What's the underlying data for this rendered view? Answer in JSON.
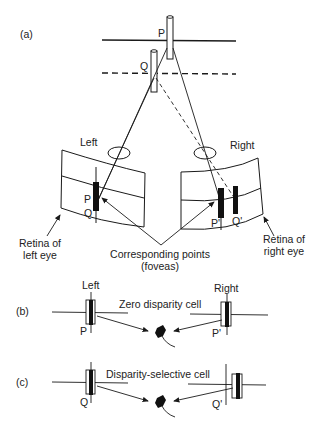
{
  "panels": {
    "a": {
      "label": "(a)",
      "point_p": "P",
      "point_q": "Q",
      "left_eye_label": "Left",
      "right_eye_label": "Right",
      "retina_left_p": "P",
      "retina_left_q": "Q",
      "retina_right_p": "P'",
      "retina_right_q": "Q'",
      "retina_left_caption_line1": "Retina of",
      "retina_left_caption_line2": "left eye",
      "retina_right_caption_line1": "Retina of",
      "retina_right_caption_line2": "right eye",
      "corresponding_line1": "Corresponding points",
      "corresponding_line2": "(foveas)"
    },
    "b": {
      "label": "(b)",
      "left_label": "Left",
      "right_label": "Right",
      "cell_caption": "Zero disparity cell",
      "left_point": "P",
      "right_point": "P'"
    },
    "c": {
      "label": "(c)",
      "cell_caption": "Disparity-selective cell",
      "left_point": "Q",
      "right_point": "Q'"
    }
  },
  "colors": {
    "ink": "#1a1a1a",
    "background": "#ffffff"
  }
}
